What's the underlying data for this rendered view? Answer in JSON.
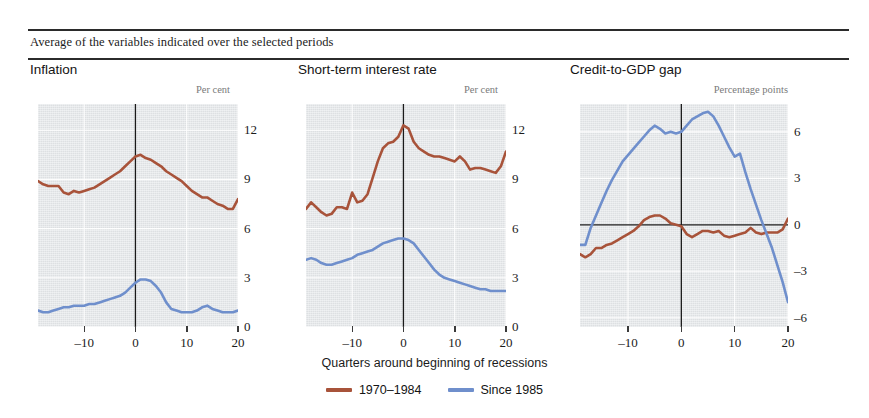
{
  "header": {
    "subtitle": "Average of the variables indicated over the selected periods"
  },
  "axis_caption": "Quarters around beginning of recessions",
  "legend": {
    "items": [
      {
        "label": "1970–1984",
        "color": "#a8533a"
      },
      {
        "label": "Since 1985",
        "color": "#6f8fcc"
      }
    ]
  },
  "colors": {
    "series_old": "#a8533a",
    "series_new": "#6f8fcc",
    "plot_background": "#e3e6e8",
    "gridline": "#ffffff",
    "axis_line": "#1a1a1a",
    "rule": "#2b2b2b"
  },
  "panels": [
    {
      "title": "Inflation",
      "unit": "Per cent",
      "ytick_labels": [
        "12",
        "9",
        "6",
        "3",
        "0"
      ],
      "xtick_labels": [
        "-10",
        "0",
        "10",
        "20"
      ]
    },
    {
      "title": "Short-term interest rate",
      "unit": "Per cent",
      "ytick_labels": [
        "12",
        "9",
        "6",
        "3",
        "0"
      ],
      "xtick_labels": [
        "-10",
        "0",
        "10",
        "20"
      ]
    },
    {
      "title": "Credit-to-GDP gap",
      "unit": "Percentage points",
      "ytick_labels": [
        "6",
        "3",
        "0",
        "-3",
        "-6"
      ],
      "xtick_labels": [
        "-10",
        "0",
        "10",
        "20"
      ]
    }
  ],
  "chart_data": [
    {
      "type": "line",
      "title": "Inflation",
      "xlabel": "Quarters around beginning of recessions",
      "ylabel": "Per cent",
      "xlim": [
        -19,
        20
      ],
      "ylim": [
        0,
        13.6
      ],
      "yticks": [
        0,
        3,
        6,
        9,
        12
      ],
      "xticks": [
        -20,
        -10,
        0,
        10,
        20
      ],
      "grid": true,
      "legend_position": "bottom",
      "x": [
        -19,
        -18,
        -17,
        -16,
        -15,
        -14,
        -13,
        -12,
        -11,
        -10,
        -9,
        -8,
        -7,
        -6,
        -5,
        -4,
        -3,
        -2,
        -1,
        0,
        1,
        2,
        3,
        4,
        5,
        6,
        7,
        8,
        9,
        10,
        11,
        12,
        13,
        14,
        15,
        16,
        17,
        18,
        19,
        20
      ],
      "series": [
        {
          "name": "1970–1984",
          "color": "#a8533a",
          "values": [
            8.9,
            8.7,
            8.6,
            8.6,
            8.6,
            8.2,
            8.1,
            8.3,
            8.2,
            8.3,
            8.4,
            8.5,
            8.7,
            8.9,
            9.1,
            9.3,
            9.5,
            9.8,
            10.1,
            10.4,
            10.5,
            10.3,
            10.2,
            10.0,
            9.8,
            9.5,
            9.3,
            9.1,
            8.9,
            8.6,
            8.3,
            8.1,
            7.9,
            7.9,
            7.7,
            7.5,
            7.4,
            7.2,
            7.2,
            7.8
          ]
        },
        {
          "name": "Since 1985",
          "color": "#6f8fcc",
          "values": [
            1.0,
            0.9,
            0.9,
            1.0,
            1.1,
            1.2,
            1.2,
            1.3,
            1.3,
            1.3,
            1.4,
            1.4,
            1.5,
            1.6,
            1.7,
            1.8,
            1.9,
            2.1,
            2.4,
            2.7,
            2.9,
            2.9,
            2.8,
            2.5,
            2.1,
            1.5,
            1.1,
            1.0,
            0.9,
            0.9,
            0.9,
            1.0,
            1.2,
            1.3,
            1.1,
            1.0,
            0.9,
            0.9,
            0.9,
            1.0
          ]
        }
      ]
    },
    {
      "type": "line",
      "title": "Short-term interest rate",
      "xlabel": "Quarters around beginning of recessions",
      "ylabel": "Per cent",
      "xlim": [
        -19,
        20
      ],
      "ylim": [
        0,
        13.6
      ],
      "yticks": [
        0,
        3,
        6,
        9,
        12
      ],
      "xticks": [
        -20,
        -10,
        0,
        10,
        20
      ],
      "grid": true,
      "legend_position": "bottom",
      "x": [
        -19,
        -18,
        -17,
        -16,
        -15,
        -14,
        -13,
        -12,
        -11,
        -10,
        -9,
        -8,
        -7,
        -6,
        -5,
        -4,
        -3,
        -2,
        -1,
        0,
        1,
        2,
        3,
        4,
        5,
        6,
        7,
        8,
        9,
        10,
        11,
        12,
        13,
        14,
        15,
        16,
        17,
        18,
        19,
        20
      ],
      "series": [
        {
          "name": "1970–1984",
          "color": "#a8533a",
          "values": [
            7.2,
            7.6,
            7.3,
            7.0,
            6.8,
            6.9,
            7.3,
            7.3,
            7.2,
            8.2,
            7.6,
            7.7,
            8.1,
            9.1,
            10.1,
            10.9,
            11.2,
            11.3,
            11.6,
            12.3,
            12.1,
            11.3,
            10.9,
            10.7,
            10.5,
            10.4,
            10.4,
            10.3,
            10.2,
            10.1,
            10.4,
            10.1,
            9.6,
            9.7,
            9.7,
            9.6,
            9.5,
            9.4,
            9.8,
            10.7
          ]
        },
        {
          "name": "Since 1985",
          "color": "#6f8fcc",
          "values": [
            4.1,
            4.2,
            4.1,
            3.9,
            3.8,
            3.8,
            3.9,
            4.0,
            4.1,
            4.2,
            4.4,
            4.5,
            4.6,
            4.7,
            4.9,
            5.1,
            5.2,
            5.3,
            5.4,
            5.4,
            5.3,
            5.1,
            4.7,
            4.3,
            3.9,
            3.5,
            3.2,
            3.0,
            2.9,
            2.8,
            2.7,
            2.6,
            2.5,
            2.4,
            2.3,
            2.3,
            2.2,
            2.2,
            2.2,
            2.2
          ]
        }
      ]
    },
    {
      "type": "line",
      "title": "Credit-to-GDP gap",
      "xlabel": "Quarters around beginning of recessions",
      "ylabel": "Percentage points",
      "xlim": [
        -19,
        20
      ],
      "ylim": [
        -6.6,
        7.8
      ],
      "yticks": [
        -6,
        -3,
        0,
        3,
        6
      ],
      "xticks": [
        -20,
        -10,
        0,
        10,
        20
      ],
      "grid": true,
      "legend_position": "bottom",
      "x": [
        -19,
        -18,
        -17,
        -16,
        -15,
        -14,
        -13,
        -12,
        -11,
        -10,
        -9,
        -8,
        -7,
        -6,
        -5,
        -4,
        -3,
        -2,
        -1,
        0,
        1,
        2,
        3,
        4,
        5,
        6,
        7,
        8,
        9,
        10,
        11,
        12,
        13,
        14,
        15,
        16,
        17,
        18,
        19,
        20
      ],
      "series": [
        {
          "name": "1970–1984",
          "color": "#a8533a",
          "values": [
            -1.9,
            -2.1,
            -1.9,
            -1.5,
            -1.5,
            -1.3,
            -1.2,
            -1.0,
            -0.8,
            -0.6,
            -0.4,
            -0.1,
            0.3,
            0.5,
            0.6,
            0.6,
            0.4,
            0.1,
            0.0,
            -0.1,
            -0.6,
            -0.8,
            -0.6,
            -0.4,
            -0.4,
            -0.5,
            -0.4,
            -0.7,
            -0.8,
            -0.7,
            -0.6,
            -0.5,
            -0.2,
            -0.5,
            -0.6,
            -0.5,
            -0.5,
            -0.5,
            -0.3,
            0.4
          ]
        },
        {
          "name": "Since 1985",
          "color": "#6f8fcc",
          "values": [
            -1.3,
            -1.3,
            -0.2,
            0.6,
            1.4,
            2.2,
            2.9,
            3.5,
            4.1,
            4.5,
            4.9,
            5.3,
            5.7,
            6.1,
            6.4,
            6.2,
            5.9,
            6.0,
            5.9,
            6.0,
            6.4,
            6.8,
            7.0,
            7.2,
            7.3,
            7.0,
            6.4,
            5.7,
            5.0,
            4.4,
            4.6,
            3.4,
            2.3,
            1.3,
            0.3,
            -0.6,
            -1.5,
            -2.6,
            -3.7,
            -5.0
          ]
        }
      ]
    }
  ]
}
